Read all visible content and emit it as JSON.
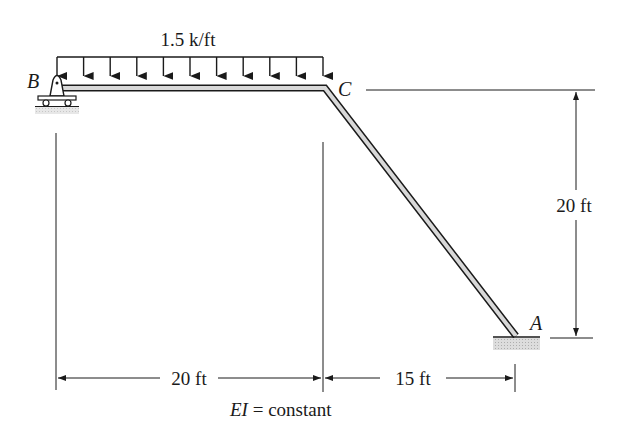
{
  "diagram": {
    "type": "structural-frame",
    "load": {
      "label": "1.5 k/ft",
      "type": "uniform-distributed",
      "arrow_count": 11,
      "span": "B to C"
    },
    "nodes": {
      "B": {
        "label": "B",
        "support": "roller"
      },
      "C": {
        "label": "C",
        "support": "rigid-joint"
      },
      "A": {
        "label": "A",
        "support": "fixed"
      }
    },
    "dimensions": {
      "horizontal_BC": "20 ft",
      "horizontal_CA": "15 ft",
      "vertical_CA": "20 ft"
    },
    "note": {
      "prefix": "EI",
      "suffix": " = constant"
    },
    "colors": {
      "ink": "#1a1a1a",
      "member_fill": "#d8d8d8",
      "ground_hatch": "#bdbdbd"
    }
  }
}
